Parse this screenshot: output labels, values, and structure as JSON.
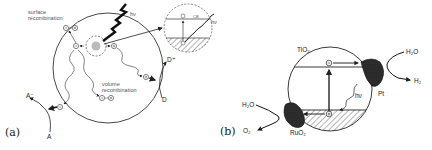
{
  "figure": {
    "panel_a": {
      "label": "(a)",
      "text": {
        "surface_recombination": [
          "surface",
          "recombination"
        ],
        "volume_recombination": [
          "volume",
          "recombination"
        ],
        "photon": "hν",
        "photon_inset": "hν",
        "acceptor": "A",
        "acceptor_reduced": "A⁻",
        "donor": "D",
        "donor_oxidized": "D⁺",
        "electron_symbol": "⊖",
        "hole_symbol": "⊕",
        "inset_cb": "CB"
      }
    },
    "panel_b": {
      "label": "(b)",
      "text": {
        "semiconductor": "TiO₂",
        "photon": "hν",
        "cathode": "Pt",
        "anode": "RuO₂",
        "water_right": "H₂O",
        "hydrogen": "H₂",
        "water_left": "H₂O",
        "oxygen": "O₂"
      }
    }
  }
}
